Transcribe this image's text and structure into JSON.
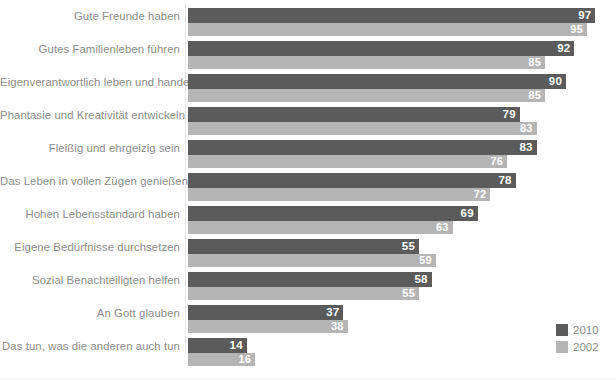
{
  "chart_data": {
    "type": "bar",
    "orientation": "horizontal",
    "title": "",
    "subtitle": "",
    "xlabel": "",
    "ylabel": "",
    "xlim": [
      0,
      100
    ],
    "grid": false,
    "legend_position": "bottom-right",
    "categories": [
      "Gute Freunde haben",
      "Gutes Familienleben führen",
      "Eigenverantwortlich leben und handeln",
      "Phantasie und Kreativität entwickeln",
      "Fleißig und ehrgeizig sein",
      "Das Leben in vollen Zügen genießen",
      "Hohen Lebensstandard haben",
      "Eigene Bedürfnisse durchsetzen",
      "Sozial Benachteiligten helfen",
      "An Gott glauben",
      "Das tun, was die anderen auch tun"
    ],
    "series": [
      {
        "name": "2010",
        "color": "#5b5b5b",
        "values": [
          97,
          92,
          90,
          79,
          83,
          78,
          69,
          55,
          58,
          37,
          14
        ]
      },
      {
        "name": "2002",
        "color": "#b5b5b5",
        "values": [
          95,
          85,
          85,
          83,
          76,
          72,
          63,
          59,
          55,
          38,
          16
        ]
      }
    ]
  },
  "legend": {
    "items": [
      {
        "label": "2010",
        "color": "#5b5b5b"
      },
      {
        "label": "2002",
        "color": "#b5b5b5"
      }
    ]
  },
  "colors": {
    "series_2010": "#5b5b5b",
    "series_2002": "#b5b5b5",
    "label_text": "#8d8d8d",
    "value_text": "#ffffff",
    "background": "#ffffff"
  }
}
